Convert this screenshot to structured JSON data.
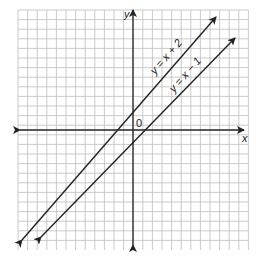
{
  "chart_data": {
    "type": "line",
    "title": "",
    "xlabel": "x",
    "ylabel": "y",
    "origin_label": "0",
    "grid": true,
    "xlim": [
      -12,
      12
    ],
    "ylim": [
      -12,
      12
    ],
    "series": [
      {
        "name": "y = x + 2",
        "slope": 1,
        "intercept": 2,
        "x": [
          -11,
          8
        ],
        "y": [
          -9,
          10
        ]
      },
      {
        "name": "y = x − 1",
        "slope": 1,
        "intercept": -1,
        "x": [
          -9,
          10
        ],
        "y": [
          -10,
          9
        ]
      }
    ],
    "colors": {
      "grid": "#bdbdbd",
      "axes": "#222222",
      "lines": "#222222"
    }
  },
  "labels": {
    "x_axis": "x",
    "y_axis": "y",
    "origin": "0",
    "line1": "y = x + 2",
    "line2": "y = x − 1"
  }
}
